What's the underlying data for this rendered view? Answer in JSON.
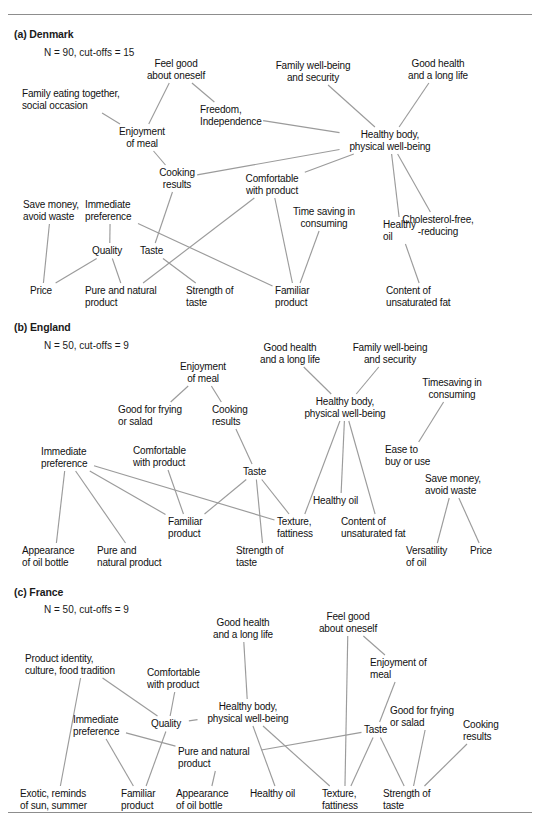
{
  "figure": {
    "type": "hierarchical-value-map",
    "rules": [
      "top",
      "bottom"
    ],
    "panels": [
      {
        "id": "denmark",
        "title": "(a) Denmark",
        "subtitle": "N = 90, cut-offs = 15",
        "title_pos": [
          14,
          8
        ],
        "sub_pos": [
          44,
          27
        ],
        "nodes": [
          {
            "id": "feel_good",
            "label": "Feel good\nabout oneself",
            "x": 176,
            "y": 38,
            "align": "c"
          },
          {
            "id": "family_wb",
            "label": "Family well-being\nand security",
            "x": 313,
            "y": 40,
            "align": "c"
          },
          {
            "id": "good_health",
            "label": "Good health\nand a long life",
            "x": 438,
            "y": 38,
            "align": "c"
          },
          {
            "id": "family_eating",
            "label": "Family eating together,\nsocial occasion",
            "x": 22,
            "y": 68,
            "align": "l"
          },
          {
            "id": "freedom",
            "label": "Freedom,\nIndependence",
            "x": 200,
            "y": 84,
            "align": "l"
          },
          {
            "id": "enjoyment",
            "label": "Enjoyment\nof meal",
            "x": 142,
            "y": 106,
            "align": "c"
          },
          {
            "id": "healthy_body",
            "label": "Healthy body,\nphysical well-being",
            "x": 390,
            "y": 109,
            "align": "c"
          },
          {
            "id": "cooking",
            "label": "Cooking\nresults",
            "x": 177,
            "y": 147,
            "align": "c"
          },
          {
            "id": "comfortable",
            "label": "Comfortable\nwith product",
            "x": 272,
            "y": 153,
            "align": "c"
          },
          {
            "id": "save_money",
            "label": "Save money,\navoid waste",
            "x": 23,
            "y": 179,
            "align": "l"
          },
          {
            "id": "immediate",
            "label": "Immediate\npreference",
            "x": 85,
            "y": 179,
            "align": "l"
          },
          {
            "id": "time_saving",
            "label": "Time saving in\nconsuming",
            "x": 324,
            "y": 186,
            "align": "c"
          },
          {
            "id": "healthy_oil",
            "label": "Healthy\noil",
            "x": 383,
            "y": 199,
            "align": "l"
          },
          {
            "id": "cholesterol",
            "label": "Cholesterol-free,\n-reducing",
            "x": 438,
            "y": 194,
            "align": "c"
          },
          {
            "id": "quality",
            "label": "Quality",
            "x": 92,
            "y": 225,
            "align": "l"
          },
          {
            "id": "taste",
            "label": "Taste",
            "x": 140,
            "y": 225,
            "align": "l"
          },
          {
            "id": "price",
            "label": "Price",
            "x": 30,
            "y": 265,
            "align": "l"
          },
          {
            "id": "pure_natural",
            "label": "Pure and natural\nproduct",
            "x": 85,
            "y": 265,
            "align": "l"
          },
          {
            "id": "strength",
            "label": "Strength of\ntaste",
            "x": 186,
            "y": 265,
            "align": "l"
          },
          {
            "id": "familiar",
            "label": "Familiar\nproduct",
            "x": 275,
            "y": 265,
            "align": "l"
          },
          {
            "id": "unsaturated",
            "label": "Content of\nunsaturated fat",
            "x": 386,
            "y": 265,
            "align": "l"
          }
        ],
        "edges": [
          [
            "feel_good",
            "enjoyment"
          ],
          [
            "feel_good",
            "freedom"
          ],
          [
            "family_eating",
            "enjoyment"
          ],
          [
            "freedom",
            "healthy_body"
          ],
          [
            "family_wb",
            "healthy_body"
          ],
          [
            "good_health",
            "healthy_body"
          ],
          [
            "enjoyment",
            "cooking"
          ],
          [
            "cooking",
            "healthy_body"
          ],
          [
            "cooking",
            "taste"
          ],
          [
            "comfortable",
            "healthy_body"
          ],
          [
            "comfortable",
            "pure_natural"
          ],
          [
            "comfortable",
            "familiar"
          ],
          [
            "healthy_body",
            "healthy_oil"
          ],
          [
            "healthy_body",
            "cholesterol"
          ],
          [
            "save_money",
            "price"
          ],
          [
            "immediate",
            "quality"
          ],
          [
            "immediate",
            "familiar"
          ],
          [
            "quality",
            "price"
          ],
          [
            "quality",
            "pure_natural"
          ],
          [
            "taste",
            "strength"
          ],
          [
            "time_saving",
            "familiar"
          ],
          [
            "healthy_oil",
            "unsaturated"
          ]
        ]
      },
      {
        "id": "england",
        "title": "(b) England",
        "subtitle": "N = 50, cut-offs = 9",
        "title_pos": [
          14,
          6
        ],
        "sub_pos": [
          44,
          25
        ],
        "nodes": [
          {
            "id": "good_health",
            "label": "Good health\nand a long life",
            "x": 290,
            "y": 27,
            "align": "c"
          },
          {
            "id": "family_wb",
            "label": "Family well-being\nand security",
            "x": 390,
            "y": 27,
            "align": "c"
          },
          {
            "id": "enjoyment",
            "label": "Enjoyment\nof meal",
            "x": 203,
            "y": 46,
            "align": "c"
          },
          {
            "id": "timesaving",
            "label": "Timesaving in\nconsuming",
            "x": 452,
            "y": 62,
            "align": "c"
          },
          {
            "id": "healthy_body",
            "label": "Healthy body,\nphysical well-being",
            "x": 345,
            "y": 81,
            "align": "c"
          },
          {
            "id": "good_frying",
            "label": "Good for frying\nor salad",
            "x": 118,
            "y": 89,
            "align": "l"
          },
          {
            "id": "cooking",
            "label": "Cooking\nresults",
            "x": 212,
            "y": 89,
            "align": "l"
          },
          {
            "id": "comfortable",
            "label": "Comfortable\nwith product",
            "x": 133,
            "y": 130,
            "align": "l"
          },
          {
            "id": "immediate",
            "label": "Immediate\npreference",
            "x": 41,
            "y": 131,
            "align": "l"
          },
          {
            "id": "ease_buy",
            "label": "Ease to\nbuy or use",
            "x": 385,
            "y": 129,
            "align": "l"
          },
          {
            "id": "taste",
            "label": "Taste",
            "x": 243,
            "y": 151,
            "align": "l"
          },
          {
            "id": "save_money",
            "label": "Save money,\navoid waste",
            "x": 425,
            "y": 158,
            "align": "l"
          },
          {
            "id": "healthy_oil",
            "label": "Healthy oil",
            "x": 313,
            "y": 180,
            "align": "l"
          },
          {
            "id": "familiar",
            "label": "Familiar\nproduct",
            "x": 168,
            "y": 201,
            "align": "l"
          },
          {
            "id": "texture",
            "label": "Texture,\nfattiness",
            "x": 277,
            "y": 201,
            "align": "l"
          },
          {
            "id": "unsaturated",
            "label": "Content of\nunsaturated fat",
            "x": 341,
            "y": 201,
            "align": "l"
          },
          {
            "id": "appearance",
            "label": "Appearance\nof oil bottle",
            "x": 22,
            "y": 230,
            "align": "l"
          },
          {
            "id": "pure_natural",
            "label": "Pure and\nnatural product",
            "x": 97,
            "y": 230,
            "align": "l"
          },
          {
            "id": "strength",
            "label": "Strength of\ntaste",
            "x": 236,
            "y": 230,
            "align": "l"
          },
          {
            "id": "versatility",
            "label": "Versatility\nof oil",
            "x": 406,
            "y": 230,
            "align": "l"
          },
          {
            "id": "price",
            "label": "Price",
            "x": 470,
            "y": 230,
            "align": "l"
          }
        ],
        "edges": [
          [
            "good_health",
            "healthy_body"
          ],
          [
            "family_wb",
            "healthy_body"
          ],
          [
            "enjoyment",
            "good_frying"
          ],
          [
            "enjoyment",
            "cooking"
          ],
          [
            "cooking",
            "taste"
          ],
          [
            "timesaving",
            "ease_buy"
          ],
          [
            "healthy_body",
            "texture"
          ],
          [
            "healthy_body",
            "healthy_oil"
          ],
          [
            "healthy_body",
            "unsaturated"
          ],
          [
            "immediate",
            "appearance"
          ],
          [
            "immediate",
            "pure_natural"
          ],
          [
            "immediate",
            "familiar"
          ],
          [
            "immediate",
            "texture"
          ],
          [
            "comfortable",
            "familiar"
          ],
          [
            "taste",
            "familiar"
          ],
          [
            "taste",
            "texture"
          ],
          [
            "taste",
            "strength"
          ],
          [
            "save_money",
            "versatility"
          ],
          [
            "save_money",
            "price"
          ]
        ]
      },
      {
        "id": "france",
        "title": "(c) France",
        "subtitle": "N = 50, cut-offs = 9",
        "title_pos": [
          14,
          6
        ],
        "sub_pos": [
          44,
          24
        ],
        "nodes": [
          {
            "id": "good_health",
            "label": "Good health\nand a long life",
            "x": 243,
            "y": 37,
            "align": "c"
          },
          {
            "id": "feel_good",
            "label": "Feel good\nabout oneself",
            "x": 348,
            "y": 31,
            "align": "c"
          },
          {
            "id": "product_id",
            "label": "Product identity,\nculture, food tradition",
            "x": 25,
            "y": 73,
            "align": "l"
          },
          {
            "id": "enjoyment",
            "label": "Enjoyment of\nmeal",
            "x": 370,
            "y": 77,
            "align": "l"
          },
          {
            "id": "comfortable",
            "label": "Comfortable\nwith product",
            "x": 147,
            "y": 87,
            "align": "l"
          },
          {
            "id": "healthy_body",
            "label": "Healthy body,\nphysical well-being",
            "x": 248,
            "y": 121,
            "align": "c"
          },
          {
            "id": "good_frying",
            "label": "Good for frying\nor salad",
            "x": 390,
            "y": 125,
            "align": "l"
          },
          {
            "id": "cooking",
            "label": "Cooking\nresults",
            "x": 463,
            "y": 139,
            "align": "l"
          },
          {
            "id": "immediate",
            "label": "Immediate\npreference",
            "x": 73,
            "y": 134,
            "align": "l"
          },
          {
            "id": "quality",
            "label": "Quality",
            "x": 151,
            "y": 138,
            "align": "l"
          },
          {
            "id": "taste",
            "label": "Taste",
            "x": 364,
            "y": 144,
            "align": "l"
          },
          {
            "id": "pure_natural",
            "label": "Pure and natural\nproduct",
            "x": 178,
            "y": 166,
            "align": "l"
          },
          {
            "id": "exotic",
            "label": "Exotic, reminds\nof sun, summer",
            "x": 20,
            "y": 208,
            "align": "l"
          },
          {
            "id": "familiar",
            "label": "Familiar\nproduct",
            "x": 121,
            "y": 208,
            "align": "l"
          },
          {
            "id": "appearance",
            "label": "Appearance\nof oil bottle",
            "x": 176,
            "y": 208,
            "align": "l"
          },
          {
            "id": "healthy_oil",
            "label": "Healthy oil",
            "x": 250,
            "y": 208,
            "align": "l"
          },
          {
            "id": "texture",
            "label": "Texture,\nfattiness",
            "x": 322,
            "y": 208,
            "align": "l"
          },
          {
            "id": "strength",
            "label": "Strength of\ntaste",
            "x": 383,
            "y": 208,
            "align": "l"
          }
        ],
        "edges": [
          [
            "good_health",
            "healthy_body"
          ],
          [
            "feel_good",
            "enjoyment"
          ],
          [
            "feel_good",
            "texture"
          ],
          [
            "product_id",
            "exotic"
          ],
          [
            "product_id",
            "quality"
          ],
          [
            "comfortable",
            "quality"
          ],
          [
            "healthy_body",
            "quality"
          ],
          [
            "healthy_body",
            "healthy_oil"
          ],
          [
            "healthy_body",
            "texture"
          ],
          [
            "enjoyment",
            "taste"
          ],
          [
            "good_frying",
            "strength"
          ],
          [
            "cooking",
            "strength"
          ],
          [
            "immediate",
            "familiar"
          ],
          [
            "immediate",
            "pure_natural"
          ],
          [
            "quality",
            "familiar"
          ],
          [
            "pure_natural",
            "taste"
          ],
          [
            "pure_natural",
            "appearance"
          ],
          [
            "taste",
            "strength"
          ],
          [
            "taste",
            "texture"
          ]
        ]
      }
    ]
  }
}
